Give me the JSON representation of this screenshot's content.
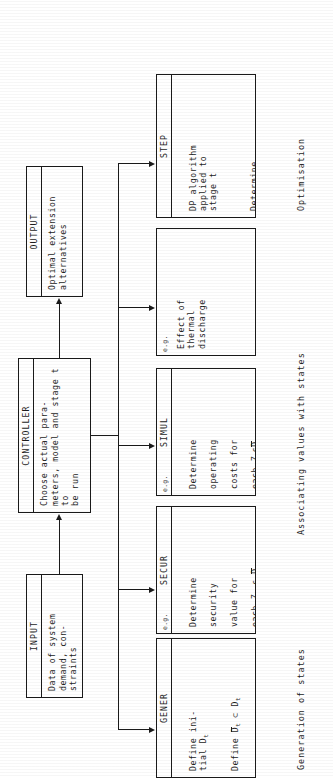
{
  "diagram": {
    "orientation": "rotated-90-ccw",
    "colors": {
      "ink": "#1d1d1d",
      "paper": "#ffffff"
    }
  },
  "boxes": {
    "input": {
      "head": "INPUT",
      "body": "Data of system\ndemand, con-\nstraints"
    },
    "controller": {
      "head": "CONTROLLER",
      "body": "Choose actual para-\nmeters, model and stage t to\nbe run"
    },
    "output": {
      "head": "OUTPUT",
      "body": "Optimal extension\nalternatives"
    },
    "gener": {
      "eg": "",
      "head": "GENER",
      "para1": "Define ini-\ntial D",
      "para1_sub": "t",
      "para2_a": "Define ",
      "para2_b": "D",
      "para2_bsub": "t",
      "para2_c": " ⊂ D",
      "para2_csub": "t",
      "para3": "Delete or re-\nactivate some\nZ",
      "para3_sub": "t"
    },
    "secur": {
      "eg": "e.g.",
      "head": "SECUR",
      "line1": "Determine",
      "line2": "security",
      "line3": "value for",
      "line4_a": "each Z",
      "line4_asub": "t",
      "line4_b": " ϵ ",
      "line4_c": "D",
      "line4_csub": "t"
    },
    "simul": {
      "eg": "e.g.",
      "head": "SIMUL",
      "line1": "Determine",
      "line2": "operating",
      "line3": "costs for",
      "line4_a": "each Z",
      "line4_asub": "t",
      "line4_b": "ϵ",
      "line4_c": "D",
      "line4_csub": "t"
    },
    "thermal": {
      "eg": "e.g.",
      "head": "",
      "body": "Effect of\nthermal\ndischarge"
    },
    "step": {
      "eg": "",
      "head": "STEP",
      "para1": "DP algorithm\napplied to\nstage t",
      "para2_l1": "Determine",
      "para2_l2": "optimal",
      "para2_l3": "subpath",
      "para2_l4a": "for each Z",
      "para2_l4asub": "t",
      "para2_l4b": "ϵ",
      "para2_l4c": "D",
      "para2_l4csub": "t"
    }
  },
  "captions": {
    "generation": "Generation of states",
    "associating": "Associating values with states",
    "optimisation": "Optimisation"
  }
}
